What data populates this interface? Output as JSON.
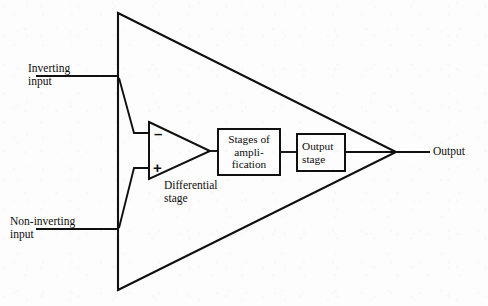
{
  "diagram": {
    "type": "block-diagram",
    "background_color": "#fdfdfd",
    "line_color": "#101010",
    "labels": {
      "inverting_input_line1": "Inverting",
      "inverting_input_line2": "input",
      "non_inverting_input_line1": "Non-inverting",
      "non_inverting_input_line2": "input",
      "output": "Output",
      "differential_stage_line1": "Differential",
      "differential_stage_line2": "stage",
      "minus_sign": "–",
      "plus_sign": "+"
    },
    "blocks": [
      {
        "id": "stages-of-amplification",
        "line1": "Stages of",
        "line2": "ampli-",
        "line3": "fication"
      },
      {
        "id": "output-stage",
        "line1": "Output",
        "line2": "stage"
      }
    ],
    "shapes": {
      "outer_triangle": "M 118,13 L 396,152 L 118,290 Z",
      "inner_triangle": "M 149,122 L 210,151 L 149,179 Z"
    },
    "wires": {
      "inverting_input_lead": "M 36,76 L 118,76",
      "inverting_to_minus": "M 119,78 L 134,133 L 149,133",
      "non_inverting_input_lead": "M 36,229 L 118,229",
      "non_inverting_to_plus": "M 119,228 L 134,168 L 149,168",
      "diff_to_stages": "M 210,151 L 218,151",
      "stages_to_output_stage": "M 280,152 L 297,152",
      "output_stage_to_apex": "M 345,152 L 396,152",
      "apex_to_output_label": "M 396,152 L 430,152"
    }
  }
}
